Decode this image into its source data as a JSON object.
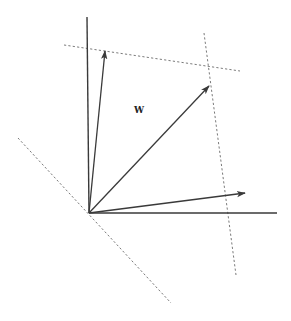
{
  "diagram": {
    "type": "vector-space-sketch",
    "label": "W",
    "colors": {
      "axis": "#3a3a3a",
      "vector": "#3a3a3a",
      "dashed": "#7a7a7a",
      "background": "#ffffff"
    },
    "origin": [
      89,
      213
    ],
    "axes": [
      {
        "name": "vertical-axis",
        "from": [
          89,
          213
        ],
        "to": [
          87,
          17
        ]
      },
      {
        "name": "horizontal-axis",
        "from": [
          89,
          213
        ],
        "to": [
          277,
          213
        ]
      }
    ],
    "vectors": [
      {
        "name": "vector-upper",
        "from": [
          89,
          213
        ],
        "to": [
          105,
          51
        ]
      },
      {
        "name": "vector-diagonal",
        "from": [
          89,
          213
        ],
        "to": [
          209,
          86
        ]
      },
      {
        "name": "vector-lower",
        "from": [
          89,
          213
        ],
        "to": [
          245,
          193
        ]
      }
    ],
    "dashed_lines": [
      {
        "name": "dashed-top",
        "from": [
          64,
          45
        ],
        "to": [
          240,
          71
        ]
      },
      {
        "name": "dashed-right",
        "from": [
          204,
          33
        ],
        "to": [
          236,
          275
        ]
      },
      {
        "name": "dashed-lower-left",
        "from": [
          18,
          138
        ],
        "to": [
          171,
          303
        ]
      }
    ],
    "label_position": [
      139,
      113
    ]
  }
}
